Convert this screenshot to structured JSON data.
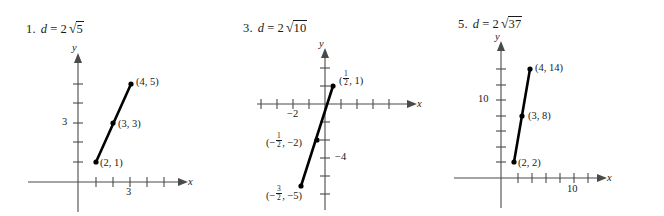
{
  "page": {
    "kind": "textbook-answer-key-diagrams",
    "figure_count": 3
  },
  "figures": [
    {
      "number": "1.",
      "answer_var": "d",
      "equals": "=",
      "coefficient": "2",
      "radicand": "5",
      "answer_text": "d = 2√5",
      "x_axis_label": "x",
      "y_axis_label": "y",
      "x_tick_label": "3",
      "y_tick_label": "3",
      "points": [
        {
          "label": "(2, 1)",
          "x": 2,
          "y": 1
        },
        {
          "label": "(3, 3)",
          "x": 3,
          "y": 3
        },
        {
          "label": "(4, 5)",
          "x": 4,
          "y": 5
        }
      ],
      "segment_from": "(2, 1)",
      "segment_to": "(4, 5)"
    },
    {
      "number": "3.",
      "answer_var": "d",
      "equals": "=",
      "coefficient": "2",
      "radicand": "10",
      "answer_text": "d = 2√10",
      "x_axis_label": "x",
      "y_axis_label": "y",
      "x_tick_label": "−2",
      "y_tick_label": "−4",
      "points": [
        {
          "label_num": "1",
          "label_den": "2",
          "label_sign": "",
          "label_tail": ", 1)",
          "x": 0.5,
          "y": 1
        },
        {
          "label_num": "1",
          "label_den": "2",
          "label_sign": "−",
          "label_tail": ", −2)",
          "x": -0.5,
          "y": -2
        },
        {
          "label_num": "3",
          "label_den": "2",
          "label_sign": "−",
          "label_tail": ", −5)",
          "x": -1.5,
          "y": -5
        }
      ],
      "segment_from": "(1/2, 1)",
      "segment_to": "(-3/2, -5)"
    },
    {
      "number": "5.",
      "answer_var": "d",
      "equals": "=",
      "coefficient": "2",
      "radicand": "37",
      "answer_text": "d = 2√37",
      "x_axis_label": "x",
      "y_axis_label": "y",
      "x_tick_label": "10",
      "y_tick_label": "10",
      "points": [
        {
          "label": "(2, 2)",
          "x": 2,
          "y": 2
        },
        {
          "label": "(3, 8)",
          "x": 3,
          "y": 8
        },
        {
          "label": "(4, 14)",
          "x": 4,
          "y": 14
        }
      ],
      "segment_from": "(2, 2)",
      "segment_to": "(4, 14)"
    }
  ],
  "colors": {
    "ink": "#1a1a1a",
    "axis": "#4a4a4a",
    "segment": "#000000",
    "background": "#ffffff"
  }
}
